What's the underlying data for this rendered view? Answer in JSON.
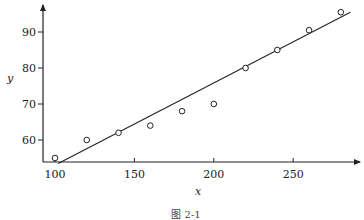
{
  "chart_data": {
    "type": "scatter",
    "title": "",
    "caption": "图 2-1",
    "xlabel": "x",
    "ylabel": "y",
    "xlim": [
      93,
      290
    ],
    "ylim": [
      53,
      98
    ],
    "xticks": [
      100,
      150,
      200,
      250
    ],
    "yticks": [
      60,
      70,
      80,
      90
    ],
    "grid": false,
    "legend": null,
    "series": [
      {
        "name": "observations",
        "marker": "open-circle",
        "x": [
          100,
          120,
          140,
          160,
          180,
          200,
          220,
          240,
          260,
          280
        ],
        "y": [
          55,
          60,
          62,
          64,
          68,
          70,
          80,
          85,
          90.5,
          95.5
        ]
      },
      {
        "name": "fitted line",
        "style": "line",
        "x": [
          102,
          286
        ],
        "y": [
          53.5,
          95.5
        ]
      }
    ]
  }
}
